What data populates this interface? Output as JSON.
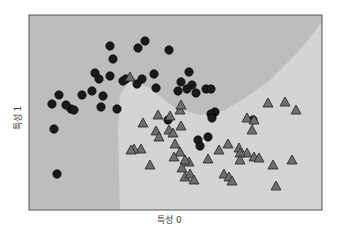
{
  "chart_data": {
    "type": "scatter",
    "title": "",
    "xlabel": "특성 0",
    "ylabel": "특성 1",
    "grid": false,
    "ticks_visible": false,
    "legend": null,
    "colors": {
      "region_class0": "#bdbdbd",
      "region_class1": "#d4d4d4",
      "circle": "#1a1a1a",
      "triangle": "#6e6e6e",
      "triangle_edge": "#222222",
      "frame": "#555555"
    },
    "plot_box_px": {
      "left": 29,
      "top": 15,
      "right": 322,
      "bottom": 210
    },
    "decision_boundary_px": [
      [
        322,
        22
      ],
      [
        300,
        50
      ],
      [
        270,
        80
      ],
      [
        245,
        98
      ],
      [
        225,
        110
      ],
      [
        200,
        115
      ],
      [
        175,
        108
      ],
      [
        150,
        88
      ],
      [
        130,
        80
      ],
      [
        120,
        95
      ],
      [
        118,
        130
      ],
      [
        120,
        210
      ]
    ],
    "series": [
      {
        "name": "class 0",
        "marker": "circle",
        "points_px": [
          [
            110,
            46
          ],
          [
            113,
            59
          ],
          [
            95,
            73
          ],
          [
            110,
            76
          ],
          [
            82,
            95
          ],
          [
            92,
            91
          ],
          [
            59,
            95
          ],
          [
            71,
            109
          ],
          [
            52,
            104
          ],
          [
            74,
            110
          ],
          [
            54,
            129
          ],
          [
            66,
            105
          ],
          [
            101,
            107
          ],
          [
            117,
            109
          ],
          [
            99,
            79
          ],
          [
            145,
            41
          ],
          [
            138,
            48
          ],
          [
            154,
            74
          ],
          [
            142,
            79
          ],
          [
            126,
            79
          ],
          [
            123,
            81
          ],
          [
            137,
            84
          ],
          [
            156,
            88
          ],
          [
            181,
            82
          ],
          [
            178,
            91
          ],
          [
            196,
            93
          ],
          [
            192,
            85
          ],
          [
            206,
            89
          ],
          [
            211,
            89
          ],
          [
            169,
            50
          ],
          [
            189,
            72
          ],
          [
            187,
            89
          ],
          [
            215,
            112
          ],
          [
            211,
            114
          ],
          [
            198,
            140
          ],
          [
            208,
            137
          ],
          [
            200,
            146
          ],
          [
            212,
            118
          ],
          [
            168,
            120
          ],
          [
            57,
            174
          ],
          [
            253,
            120
          ],
          [
            103,
            96
          ]
        ]
      },
      {
        "name": "class 1",
        "marker": "triangle",
        "points_px": [
          [
            130,
            77
          ],
          [
            143,
            123
          ],
          [
            158,
            115
          ],
          [
            170,
            116
          ],
          [
            169,
            130
          ],
          [
            181,
            126
          ],
          [
            180,
            110
          ],
          [
            181,
            105
          ],
          [
            173,
            133
          ],
          [
            156,
            131
          ],
          [
            141,
            149
          ],
          [
            134,
            149
          ],
          [
            131,
            150
          ],
          [
            150,
            165
          ],
          [
            189,
            162
          ],
          [
            159,
            137
          ],
          [
            180,
            152
          ],
          [
            175,
            144
          ],
          [
            174,
            157
          ],
          [
            185,
            160
          ],
          [
            182,
            168
          ],
          [
            208,
            159
          ],
          [
            185,
            177
          ],
          [
            190,
            174
          ],
          [
            194,
            180
          ],
          [
            224,
            174
          ],
          [
            229,
            177
          ],
          [
            232,
            181
          ],
          [
            247,
            118
          ],
          [
            254,
            120
          ],
          [
            252,
            130
          ],
          [
            247,
            153
          ],
          [
            228,
            144
          ],
          [
            239,
            148
          ],
          [
            219,
            150
          ],
          [
            240,
            153
          ],
          [
            240,
            160
          ],
          [
            254,
            157
          ],
          [
            259,
            158
          ],
          [
            268,
            103
          ],
          [
            285,
            102
          ],
          [
            296,
            110
          ],
          [
            273,
            165
          ],
          [
            276,
            186
          ],
          [
            292,
            160
          ]
        ]
      }
    ]
  }
}
